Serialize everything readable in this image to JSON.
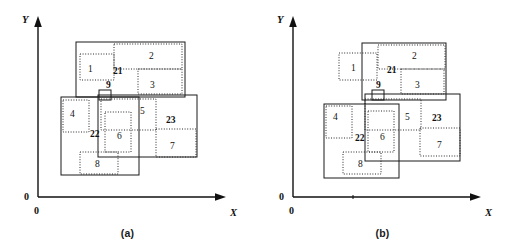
{
  "figure": {
    "title": "",
    "panels": [
      {
        "id": "a",
        "caption": "(a)",
        "axes": {
          "x_label": "X",
          "y_label": "Y",
          "origin_label_y": "0",
          "origin_label_x": "0"
        },
        "solid_rects": [
          {
            "name": "21",
            "label": "21",
            "x": 76,
            "y": 42,
            "w": 109,
            "h": 55
          },
          {
            "name": "22",
            "label": "22",
            "x": 61,
            "y": 97,
            "w": 78,
            "h": 78
          },
          {
            "name": "23",
            "label": "23",
            "x": 98,
            "y": 95,
            "w": 99,
            "h": 62
          },
          {
            "name": "9",
            "label": "9",
            "x": 99,
            "y": 90,
            "w": 12,
            "h": 10
          }
        ],
        "dotted_rects": [
          {
            "name": "1",
            "label": "1",
            "x": 80,
            "y": 54,
            "w": 34,
            "h": 26
          },
          {
            "name": "2",
            "label": "2",
            "x": 114,
            "y": 44,
            "w": 68,
            "h": 25
          },
          {
            "name": "3",
            "label": "3",
            "x": 138,
            "y": 69,
            "w": 44,
            "h": 25
          },
          {
            "name": "4",
            "label": "4",
            "x": 63,
            "y": 100,
            "w": 26,
            "h": 32
          },
          {
            "name": "5",
            "label": "5",
            "x": 101,
            "y": 99,
            "w": 55,
            "h": 31
          },
          {
            "name": "6",
            "label": "6",
            "x": 105,
            "y": 112,
            "w": 26,
            "h": 40
          },
          {
            "name": "7",
            "label": "7",
            "x": 156,
            "y": 129,
            "w": 40,
            "h": 28
          },
          {
            "name": "8",
            "label": "8",
            "x": 80,
            "y": 152,
            "w": 38,
            "h": 22
          }
        ],
        "labels": [
          {
            "text": "1",
            "x": 88,
            "y": 72,
            "bold": false
          },
          {
            "text": "2",
            "x": 149,
            "y": 59,
            "bold": false
          },
          {
            "text": "3",
            "x": 150,
            "y": 88,
            "bold": false
          },
          {
            "text": "4",
            "x": 70,
            "y": 117,
            "bold": false
          },
          {
            "text": "5",
            "x": 140,
            "y": 114,
            "bold": false
          },
          {
            "text": "6",
            "x": 117,
            "y": 139,
            "bold": false
          },
          {
            "text": "7",
            "x": 170,
            "y": 149,
            "bold": false
          },
          {
            "text": "8",
            "x": 95,
            "y": 167,
            "bold": false
          },
          {
            "text": "9",
            "x": 106,
            "y": 88,
            "bold": true
          },
          {
            "text": "21",
            "x": 113,
            "y": 74,
            "bold": true
          },
          {
            "text": "22",
            "x": 90,
            "y": 137,
            "bold": true
          },
          {
            "text": "23",
            "x": 166,
            "y": 123,
            "bold": true
          }
        ]
      },
      {
        "id": "b",
        "caption": "(b)",
        "axes": {
          "x_label": "X",
          "y_label": "Y",
          "origin_label_y": "0",
          "origin_label_x": "0"
        },
        "solid_rects": [
          {
            "name": "21",
            "label": "21",
            "x": 362,
            "y": 43,
            "w": 84,
            "h": 57
          },
          {
            "name": "22",
            "label": "22",
            "x": 324,
            "y": 104,
            "w": 75,
            "h": 74
          },
          {
            "name": "23",
            "label": "23",
            "x": 365,
            "y": 94,
            "w": 95,
            "h": 67
          },
          {
            "name": "9",
            "label": "9",
            "x": 372,
            "y": 90,
            "w": 12,
            "h": 10
          }
        ],
        "dotted_rects": [
          {
            "name": "1",
            "label": "1",
            "x": 339,
            "y": 53,
            "w": 38,
            "h": 27
          },
          {
            "name": "2",
            "label": "2",
            "x": 378,
            "y": 45,
            "w": 67,
            "h": 24
          },
          {
            "name": "3",
            "label": "3",
            "x": 401,
            "y": 69,
            "w": 43,
            "h": 25
          },
          {
            "name": "4",
            "label": "4",
            "x": 326,
            "y": 106,
            "w": 26,
            "h": 32
          },
          {
            "name": "5",
            "label": "5",
            "x": 365,
            "y": 99,
            "w": 56,
            "h": 31
          },
          {
            "name": "6",
            "label": "6",
            "x": 368,
            "y": 111,
            "w": 26,
            "h": 41
          },
          {
            "name": "7",
            "label": "7",
            "x": 420,
            "y": 128,
            "w": 40,
            "h": 28
          },
          {
            "name": "8",
            "label": "8",
            "x": 343,
            "y": 152,
            "w": 38,
            "h": 22
          }
        ],
        "labels": [
          {
            "text": "1",
            "x": 351,
            "y": 71,
            "bold": false
          },
          {
            "text": "2",
            "x": 412,
            "y": 59,
            "bold": false
          },
          {
            "text": "3",
            "x": 415,
            "y": 88,
            "bold": false
          },
          {
            "text": "4",
            "x": 333,
            "y": 120,
            "bold": false
          },
          {
            "text": "5",
            "x": 405,
            "y": 120,
            "bold": false
          },
          {
            "text": "6",
            "x": 380,
            "y": 140,
            "bold": false
          },
          {
            "text": "7",
            "x": 437,
            "y": 148,
            "bold": false
          },
          {
            "text": "8",
            "x": 358,
            "y": 167,
            "bold": false
          },
          {
            "text": "9",
            "x": 376,
            "y": 88,
            "bold": true
          },
          {
            "text": "21",
            "x": 387,
            "y": 73,
            "bold": true
          },
          {
            "text": "22",
            "x": 355,
            "y": 141,
            "bold": true
          },
          {
            "text": "23",
            "x": 432,
            "y": 121,
            "bold": true
          }
        ]
      }
    ]
  }
}
